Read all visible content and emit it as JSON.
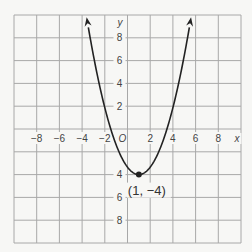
{
  "chart_data": {
    "type": "line",
    "title": "",
    "xlabel": "x",
    "ylabel": "y",
    "origin_label": "O",
    "xlim": [
      -10,
      10
    ],
    "ylim": [
      -10,
      10
    ],
    "grid": true,
    "grid_step": 2,
    "x_ticks": [
      -8,
      -6,
      -4,
      -2,
      2,
      4,
      6,
      8
    ],
    "x_tick_labels": [
      "−8",
      "−6",
      "−4",
      "−2",
      "2",
      "4",
      "6",
      "8"
    ],
    "y_ticks": [
      8,
      6,
      4,
      2,
      -4,
      -6,
      -8
    ],
    "y_tick_labels": [
      "8",
      "6",
      "4",
      "2",
      "4",
      "6",
      "8"
    ],
    "series": [
      {
        "name": "parabola",
        "kind": "parabola",
        "vertex": [
          1,
          -4
        ],
        "opens": "up",
        "approx_x_intercepts": [
          -1.35,
          3.3
        ],
        "arrow_tips": [
          [
            -3.6,
            9.8
          ],
          [
            5.6,
            9.8
          ]
        ],
        "color": "#222222"
      }
    ],
    "annotations": [
      {
        "text": "(1, −4)",
        "point": [
          1,
          -4
        ],
        "marker": "filled-circle"
      }
    ]
  },
  "colors": {
    "background": "#f7f7f5",
    "grid": "#a8a8a8",
    "curve": "#222222",
    "text": "#444444"
  }
}
